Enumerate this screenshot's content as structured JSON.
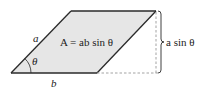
{
  "diagram": {
    "type": "parallelogram-area",
    "colors": {
      "fill": "#e6e6e6",
      "stroke": "#2a2a2a",
      "dashed": "#999999",
      "background": "#ffffff"
    },
    "labels": {
      "side_a": "a",
      "side_b": "b",
      "angle": "θ",
      "area_formula": "A = ab sin θ",
      "height": "a sin θ"
    }
  }
}
